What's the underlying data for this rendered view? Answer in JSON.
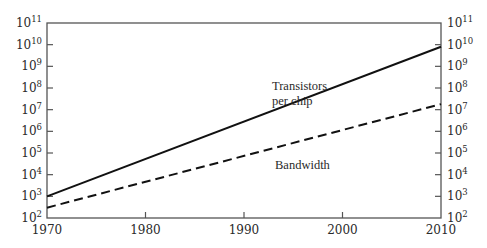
{
  "chart_data": {
    "type": "line",
    "title": "",
    "xlabel": "",
    "ylabel": "",
    "yscale": "log",
    "xlim": [
      1970,
      2010
    ],
    "ylim": [
      100,
      100000000000
    ],
    "grid": false,
    "legend": "none (inline annotations)",
    "x_ticks": [
      1970,
      1980,
      1990,
      2000,
      2010
    ],
    "y_ticks": [
      {
        "base": "10",
        "exp": "2"
      },
      {
        "base": "10",
        "exp": "3"
      },
      {
        "base": "10",
        "exp": "4"
      },
      {
        "base": "10",
        "exp": "5"
      },
      {
        "base": "10",
        "exp": "6"
      },
      {
        "base": "10",
        "exp": "7"
      },
      {
        "base": "10",
        "exp": "8"
      },
      {
        "base": "10",
        "exp": "9"
      },
      {
        "base": "10",
        "exp": "10"
      },
      {
        "base": "10",
        "exp": "11"
      }
    ],
    "y_ticks_mirrored_right": true,
    "series": [
      {
        "name": "Transistors per chip",
        "label_lines": [
          "Transistors",
          "per chip"
        ],
        "style": "solid",
        "color": "#111111",
        "x": [
          1970,
          2010
        ],
        "values": [
          1000,
          8000000000
        ]
      },
      {
        "name": "Bandwidth",
        "label_lines": [
          "Bandwidth"
        ],
        "style": "dashed",
        "color": "#111111",
        "x": [
          1970,
          2010
        ],
        "values": [
          300,
          18000000
        ]
      }
    ]
  },
  "layout": {
    "plot_left": 47,
    "plot_right": 441,
    "plot_top": 23,
    "plot_bottom": 218,
    "axis_color": "#555555"
  }
}
